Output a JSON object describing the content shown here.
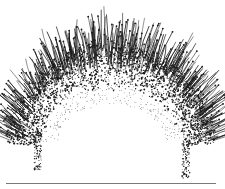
{
  "illustration": {
    "subject": "ink stipple arc of hair-like strokes",
    "ink_color": "#1a1a1a",
    "background": "#ffffff",
    "baseline_color": "#7a7a7a"
  }
}
